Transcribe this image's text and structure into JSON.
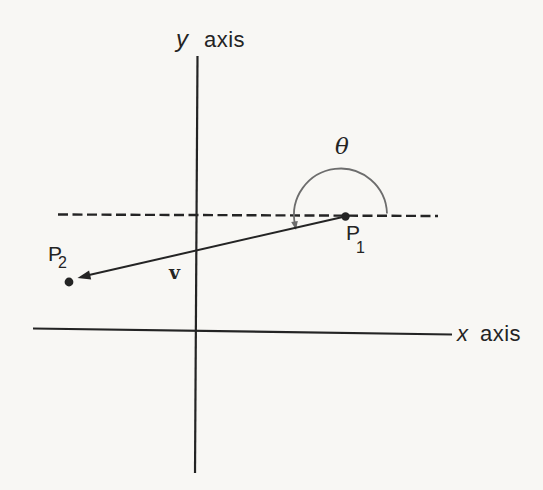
{
  "figure": {
    "colors": {
      "background": "#f8f7f4",
      "ink": "#242424",
      "arc": "#6d6d6d"
    },
    "labels": {
      "y_axis_symbol": "y",
      "y_axis_word": "axis",
      "x_axis_symbol": "x",
      "x_axis_word": "axis",
      "angle_symbol": "θ",
      "p1_letter": "P",
      "p1_subscript": "1",
      "p2_letter": "P",
      "p2_subscript": "2",
      "vector_symbol": "v"
    }
  }
}
